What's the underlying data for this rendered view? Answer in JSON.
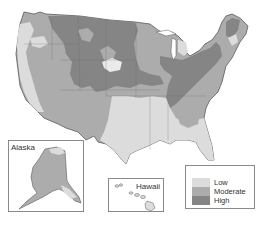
{
  "map": {
    "type": "choropleth",
    "region": "United States",
    "colors": {
      "low": "#dcdcdc",
      "moderate": "#acacac",
      "high": "#858585",
      "outline": "#5a5a5a",
      "background": "#ffffff"
    }
  },
  "insets": {
    "alaska": {
      "label": "Alaska"
    },
    "hawaii": {
      "label": "Hawaii"
    }
  },
  "legend": {
    "items": [
      {
        "label": "Low",
        "color": "#dcdcdc"
      },
      {
        "label": "Moderate",
        "color": "#acacac"
      },
      {
        "label": "High",
        "color": "#858585"
      }
    ]
  }
}
